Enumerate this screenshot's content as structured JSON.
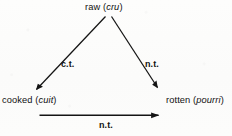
{
  "figure": {
    "ink_color": "#111111",
    "background_color": "#fcfcfb"
  },
  "nodes": {
    "raw": {
      "english": "raw",
      "foreign_open": "(",
      "foreign": "cru",
      "foreign_close": ")"
    },
    "cooked": {
      "english": "cooked",
      "foreign_open": "(",
      "foreign": "cuit",
      "foreign_close": ")"
    },
    "rotten": {
      "english": "rotten",
      "foreign_open": "(",
      "foreign": "pourri",
      "foreign_close": ")"
    }
  },
  "edges": {
    "raw_to_cooked": {
      "label": "c.t."
    },
    "raw_to_rotten": {
      "label": "n.t."
    },
    "cooked_to_rotten": {
      "label": "n.t."
    }
  }
}
